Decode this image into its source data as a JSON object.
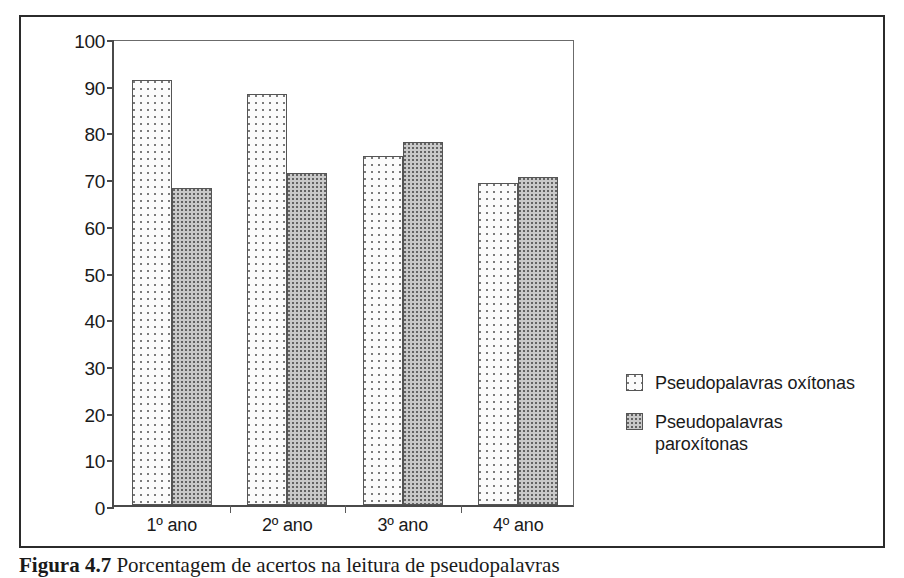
{
  "figure": {
    "caption_label": "Figura 4.7",
    "caption_text": " Porcentagem de acertos na leitura de pseudopalavras"
  },
  "chart_data": {
    "type": "bar",
    "title": "",
    "subtitle": "",
    "xlabel": "",
    "ylabel": "",
    "categories": [
      "1º ano",
      "2º ano",
      "3º ano",
      "4º ano"
    ],
    "series": [
      {
        "name": "Pseudopalavras oxítonas",
        "values": [
          91.0,
          88.0,
          74.8,
          69.0
        ],
        "fill": "light-dotted",
        "color": "#fbfbfb"
      },
      {
        "name": "Pseudopalavras paroxítonas",
        "values": [
          67.8,
          71.2,
          77.7,
          70.2
        ],
        "fill": "gray-dotted",
        "color": "#c9c9c9"
      }
    ],
    "ylim": [
      0,
      100
    ],
    "yticks": [
      0,
      10,
      20,
      30,
      40,
      50,
      60,
      70,
      80,
      90,
      100
    ],
    "ytick_labels": [
      "0",
      "10",
      "20",
      "30",
      "40",
      "50",
      "60",
      "70",
      "80",
      "90",
      "100"
    ],
    "grid": false,
    "legend_position": "right",
    "legend": [
      {
        "label": "Pseudopalavras oxítonas",
        "wrap": false
      },
      {
        "label": "Pseudopalavras\nparoxítonas",
        "wrap": true
      }
    ]
  }
}
